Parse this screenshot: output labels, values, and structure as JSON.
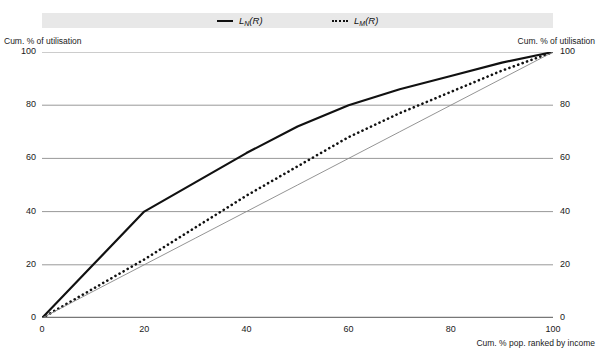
{
  "legend": {
    "background_color": "#e8e8e8",
    "entries": [
      {
        "name": "series-ln",
        "style": "solid",
        "base": "L",
        "sub": "N",
        "arg": "(R)"
      },
      {
        "name": "series-lm",
        "style": "dotted",
        "base": "L",
        "sub": "M",
        "arg": "(R)"
      }
    ]
  },
  "axes": {
    "left_caption": "Cum. % of utilisation",
    "right_caption": "Cum. % of utilisation",
    "xlabel": "Cum. % pop. ranked by income",
    "yticks": [
      "0",
      "20",
      "40",
      "60",
      "80",
      "100"
    ],
    "xticks": [
      "0",
      "20",
      "40",
      "60",
      "80",
      "100"
    ]
  },
  "chart_data": {
    "type": "line",
    "title": "",
    "subtitle": "",
    "xlabel": "Cum. % pop. ranked by income",
    "ylabel": "Cum. % of utilisation",
    "xlim": [
      0,
      100
    ],
    "ylim": [
      0,
      100
    ],
    "grid": "horizontal",
    "legend_position": "top",
    "axis_color": "#777777",
    "gridline_color": "#999999",
    "curve_color": "#111111",
    "equality_line_color": "#888888",
    "x": [
      0,
      10,
      20,
      30,
      40,
      50,
      60,
      70,
      80,
      90,
      100
    ],
    "series": [
      {
        "name": "L_N(R)",
        "label": "LN(R)",
        "style": "solid",
        "values": [
          0,
          20,
          40,
          51,
          62,
          72,
          80,
          86,
          91,
          96,
          100
        ]
      },
      {
        "name": "L_M(R)",
        "label": "LM(R)",
        "style": "dotted",
        "values": [
          0,
          11,
          22,
          34,
          46,
          57,
          68,
          77,
          85,
          93,
          100
        ]
      },
      {
        "name": "line-of-equality",
        "label": "",
        "style": "thin-solid",
        "values": [
          0,
          10,
          20,
          30,
          40,
          50,
          60,
          70,
          80,
          90,
          100
        ]
      }
    ],
    "annotations": []
  }
}
